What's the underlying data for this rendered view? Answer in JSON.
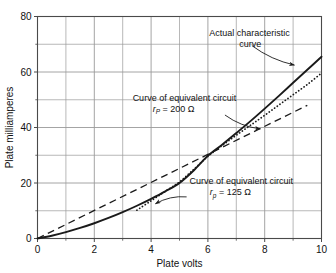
{
  "chart_data": {
    "type": "line",
    "title": "",
    "xlabel": "Plate volts",
    "ylabel": "Plate milliamperes",
    "xlim": [
      0,
      10
    ],
    "ylim": [
      0,
      80
    ],
    "x_ticks": [
      "0",
      "2",
      "4",
      "6",
      "8",
      "10"
    ],
    "x_tick_values": [
      0,
      2,
      4,
      6,
      8,
      10
    ],
    "x_minor_step": 1,
    "y_ticks": [
      "0",
      "20",
      "40",
      "60",
      "80"
    ],
    "y_tick_values": [
      0,
      20,
      40,
      60,
      80
    ],
    "y_minor_step": 10,
    "grid": true,
    "legend_position": "none",
    "series": [
      {
        "name": "Actual characteristic curve",
        "style": "solid",
        "x": [
          0,
          0.5,
          1,
          1.5,
          2,
          2.5,
          3,
          3.5,
          4,
          4.5,
          5,
          5.5,
          6,
          6.5,
          7,
          7.5,
          8,
          8.5,
          9,
          9.5,
          10
        ],
        "values": [
          0,
          1.0,
          2.3,
          3.8,
          5.5,
          7.4,
          9.5,
          11.8,
          14.3,
          17.0,
          20.0,
          24.5,
          29.8,
          33.8,
          38.0,
          42.3,
          46.8,
          51.4,
          56.1,
          60.8,
          65.5
        ]
      },
      {
        "name": "Curve of equivalent circuit rp = 125 ohm",
        "style": "dotted",
        "x": [
          3.5,
          4,
          4.5,
          5,
          5.5,
          6,
          6.5,
          7,
          7.5,
          8,
          8.5,
          9,
          9.5,
          10
        ],
        "values": [
          10.2,
          13.6,
          17.0,
          20.4,
          24.9,
          29.6,
          33.5,
          37.2,
          40.8,
          44.4,
          48.1,
          51.8,
          55.5,
          59.6
        ]
      },
      {
        "name": "Curve of equivalent circuit rP = 200 ohm",
        "style": "dashed",
        "x": [
          0,
          9.5
        ],
        "values": [
          0,
          48.0
        ]
      }
    ],
    "annotations": [
      {
        "id": "actual-curve",
        "lines": [
          "Actual characteristic",
          "curve"
        ],
        "text_x": 6.05,
        "text_y": 73.0,
        "arrow_from_x": 7.55,
        "arrow_from_y": 69.5,
        "arrow_to_x": 9.05,
        "arrow_to_y": 62.5
      },
      {
        "id": "equiv-200",
        "lines": [
          "Curve of equivalent circuit"
        ],
        "symbol_r": "r",
        "symbol_sub": "P",
        "symbol_eq": "= 200",
        "symbol_unit": "Ω",
        "text_x": 3.35,
        "text_y": 49.5,
        "arrow_from_x": 6.6,
        "arrow_from_y": 44.5,
        "arrow_to_x": 7.85,
        "arrow_to_y": 39.5
      },
      {
        "id": "equiv-125",
        "lines": [
          "Curve of equivalent circuit"
        ],
        "symbol_r": "r",
        "symbol_sub": "p",
        "symbol_eq": "= 125",
        "symbol_unit": "Ω",
        "text_x": 5.35,
        "text_y": 19.5,
        "arrow_from_x": 5.25,
        "arrow_from_y": 15.0,
        "arrow_to_x": 4.15,
        "arrow_to_y": 12.5
      }
    ],
    "colors": {
      "curve": "#1a1a1a",
      "grid": "#9a9a9a",
      "frame": "#4a4a4a",
      "text": "#111111",
      "background": "#ffffff"
    }
  }
}
